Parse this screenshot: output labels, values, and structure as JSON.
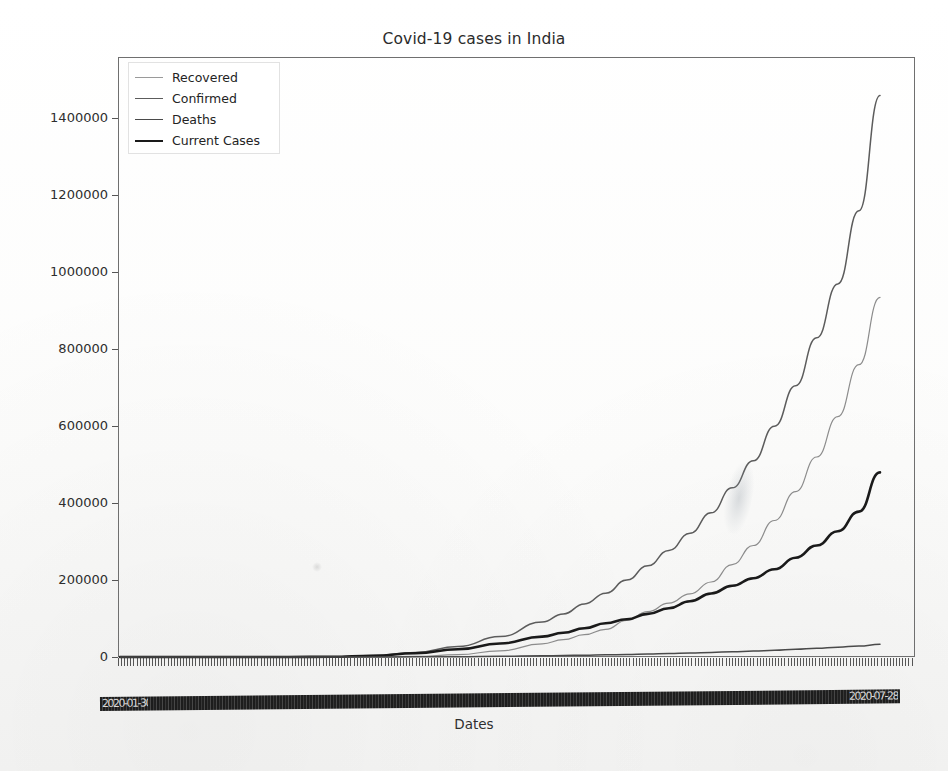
{
  "figure": {
    "background_color": "#fbfbfa",
    "title": "Covid-19 cases in India",
    "xlabel": "Dates",
    "ylabel": ""
  },
  "legend": {
    "position": "upper left",
    "entries": [
      {
        "label": "Recovered",
        "color": "#8c8c8c",
        "width": 1.0
      },
      {
        "label": "Confirmed",
        "color": "#5c5c5c",
        "width": 1.4
      },
      {
        "label": "Deaths",
        "color": "#4a4a4a",
        "width": 1.4
      },
      {
        "label": "Current Cases",
        "color": "#1a1a1a",
        "width": 2.6
      }
    ]
  },
  "axes": {
    "y_ticks": [
      0,
      200000,
      400000,
      600000,
      800000,
      1000000,
      1200000,
      1400000
    ],
    "y_tick_labels": [
      "0",
      "200000",
      "400000",
      "600000",
      "800000",
      "1000000",
      "1200000",
      "1400000"
    ],
    "ylim": [
      -40000,
      1560000
    ],
    "x_tick_band_text_left": "2020-01-30",
    "x_tick_band_text_right": "2020-07-28",
    "x_tick_note": "dense overlapping date tick labels rendered as an unreadable black band",
    "grid": false
  },
  "chart_data": {
    "type": "line",
    "title": "Covid-19 cases in India",
    "xlabel": "Dates",
    "ylabel": "",
    "ylim": [
      -40000,
      1560000
    ],
    "xlim": [
      0,
      180
    ],
    "grid": false,
    "legend_position": "upper left",
    "x_description": "Dates from 2020-01-30 to 2020-07-28 (181 daily points)",
    "x": [
      0,
      10,
      20,
      30,
      40,
      50,
      60,
      70,
      80,
      90,
      100,
      105,
      110,
      115,
      120,
      125,
      130,
      135,
      140,
      145,
      150,
      155,
      160,
      165,
      170,
      175,
      180
    ],
    "series": [
      {
        "name": "Confirmed",
        "color": "#5c5c5c",
        "final_value": 1460000,
        "values": [
          0,
          1,
          3,
          5,
          60,
          500,
          3600,
          12000,
          27000,
          53000,
          91000,
          112000,
          138000,
          166000,
          200000,
          237000,
          277000,
          322000,
          375000,
          440000,
          510000,
          600000,
          705000,
          830000,
          970000,
          1160000,
          1460000
        ]
      },
      {
        "name": "Recovered",
        "color": "#8c8c8c",
        "final_value": 935000,
        "values": [
          0,
          0,
          1,
          3,
          5,
          40,
          300,
          1500,
          6000,
          16000,
          34000,
          45000,
          58000,
          72000,
          95000,
          118000,
          140000,
          164000,
          195000,
          240000,
          290000,
          355000,
          430000,
          520000,
          625000,
          760000,
          935000
        ]
      },
      {
        "name": "Current Cases",
        "color": "#1a1a1a",
        "final_value": 480000,
        "values": [
          0,
          1,
          2,
          2,
          52,
          440,
          3100,
          10000,
          20000,
          35000,
          53000,
          63000,
          75000,
          88000,
          98000,
          112000,
          127000,
          145000,
          165000,
          185000,
          205000,
          228000,
          258000,
          290000,
          327000,
          378000,
          480000
        ]
      },
      {
        "name": "Deaths",
        "color": "#4a4a4a",
        "final_value": 33000,
        "values": [
          0,
          0,
          0,
          0,
          2,
          12,
          110,
          400,
          850,
          1700,
          3000,
          3800,
          4700,
          5600,
          6600,
          7700,
          9000,
          10500,
          12000,
          13600,
          15500,
          17500,
          20000,
          22500,
          25500,
          28500,
          33000
        ]
      }
    ]
  }
}
